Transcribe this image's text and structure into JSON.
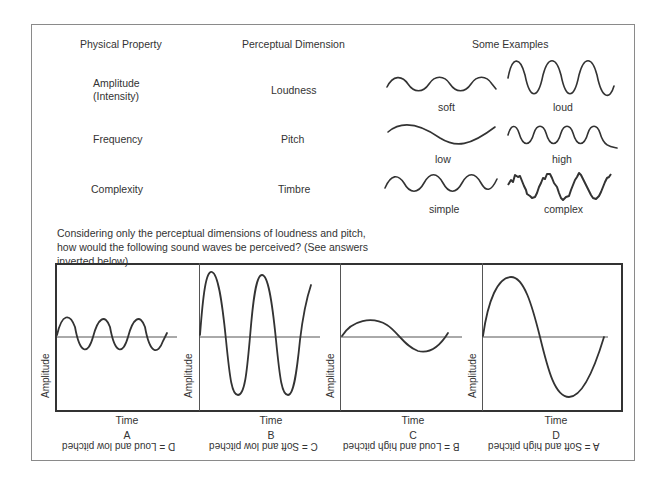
{
  "header": {
    "col1": "Physical Property",
    "col2": "Perceptual Dimension",
    "col3": "Some Examples"
  },
  "rows": [
    {
      "property_line1": "Amplitude",
      "property_line2": "(Intensity)",
      "dimension": "Loudness",
      "example_left": "soft",
      "example_right": "loud"
    },
    {
      "property": "Frequency",
      "dimension": "Pitch",
      "example_left": "low",
      "example_right": "high"
    },
    {
      "property": "Complexity",
      "dimension": "Timbre",
      "example_left": "simple",
      "example_right": "complex"
    }
  ],
  "prompt": "Considering only the perceptual dimensions of loudness and pitch, how would the following sound waves be perceived? (See answers inverted below)",
  "panels": [
    {
      "letter": "A",
      "ylabel": "Amplitude",
      "xlabel": "Time",
      "answer_inverted": "D = Loud and low pitched"
    },
    {
      "letter": "B",
      "ylabel": "Amplitude",
      "xlabel": "Time",
      "answer_inverted": "C = Soft and low pitched"
    },
    {
      "letter": "C",
      "ylabel": "Amplitude",
      "xlabel": "Time",
      "answer_inverted": "B = Loud and high pitched"
    },
    {
      "letter": "D",
      "ylabel": "Amplitude",
      "xlabel": "Time",
      "answer_inverted": "A = Soft and high pitched"
    }
  ],
  "colors": {
    "line": "#333333",
    "border": "#8a8a8a"
  }
}
